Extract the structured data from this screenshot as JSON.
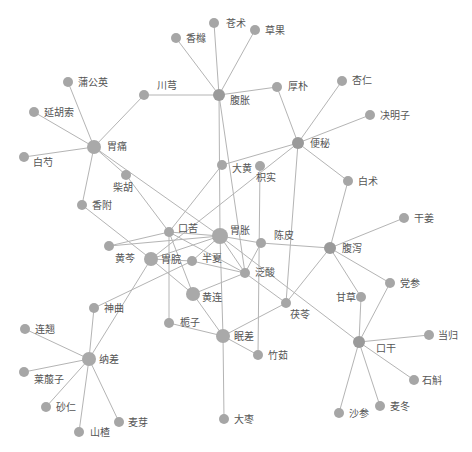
{
  "diagram": {
    "type": "network",
    "caption": "",
    "colors": {
      "edge": "#b4b4b4",
      "node": "#a6a6a6",
      "label": "#555555"
    },
    "nodes": [
      {
        "id": "cangzhu",
        "label": "苍术",
        "x": 214,
        "y": 23,
        "r": 5,
        "lx": 226,
        "ly": 27
      },
      {
        "id": "caoguo",
        "label": "草果",
        "x": 255,
        "y": 30,
        "r": 5,
        "lx": 265,
        "ly": 34
      },
      {
        "id": "xiangyuan",
        "label": "香橼",
        "x": 176,
        "y": 38,
        "r": 5,
        "lx": 186,
        "ly": 42
      },
      {
        "id": "fuzhang",
        "label": "腹胀",
        "x": 219,
        "y": 95,
        "r": 6,
        "lx": 230,
        "ly": 104
      },
      {
        "id": "houpo",
        "label": "厚朴",
        "x": 277,
        "y": 87,
        "r": 5,
        "lx": 288,
        "ly": 90
      },
      {
        "id": "xingren",
        "label": "杏仁",
        "x": 342,
        "y": 81,
        "r": 5,
        "lx": 352,
        "ly": 84
      },
      {
        "id": "juemingzi",
        "label": "决明子",
        "x": 370,
        "y": 115,
        "r": 5,
        "lx": 380,
        "ly": 119
      },
      {
        "id": "bianmi",
        "label": "便秘",
        "x": 298,
        "y": 143,
        "r": 6,
        "lx": 310,
        "ly": 147
      },
      {
        "id": "chuanxiong",
        "label": "川芎",
        "x": 144,
        "y": 95,
        "r": 5,
        "lx": 157,
        "ly": 89
      },
      {
        "id": "pugongying",
        "label": "蒲公英",
        "x": 68,
        "y": 82,
        "r": 5,
        "lx": 78,
        "ly": 86
      },
      {
        "id": "yanhusuo",
        "label": "延胡索",
        "x": 34,
        "y": 112,
        "r": 5,
        "lx": 44,
        "ly": 116
      },
      {
        "id": "weitong",
        "label": "胃痛",
        "x": 94,
        "y": 147,
        "r": 7,
        "lx": 107,
        "ly": 150
      },
      {
        "id": "baishao",
        "label": "白芍",
        "x": 24,
        "y": 157,
        "r": 5,
        "lx": 33,
        "ly": 166
      },
      {
        "id": "chaihu",
        "label": "柴胡",
        "x": 126,
        "y": 175,
        "r": 5,
        "lx": 113,
        "ly": 191
      },
      {
        "id": "xiangfu",
        "label": "香附",
        "x": 82,
        "y": 205,
        "r": 5,
        "lx": 92,
        "ly": 209
      },
      {
        "id": "dahuang",
        "label": "大黄",
        "x": 222,
        "y": 165,
        "r": 5,
        "lx": 232,
        "ly": 172
      },
      {
        "id": "zhishi",
        "label": "枳实",
        "x": 260,
        "y": 166,
        "r": 5,
        "lx": 256,
        "ly": 181
      },
      {
        "id": "baizhu",
        "label": "白术",
        "x": 348,
        "y": 181,
        "r": 5,
        "lx": 358,
        "ly": 185
      },
      {
        "id": "ganjiang",
        "label": "干姜",
        "x": 404,
        "y": 218,
        "r": 5,
        "lx": 414,
        "ly": 222
      },
      {
        "id": "kouku",
        "label": "口苦",
        "x": 169,
        "y": 232,
        "r": 5,
        "lx": 178,
        "ly": 232
      },
      {
        "id": "weizhang",
        "label": "胃胀",
        "x": 220,
        "y": 236,
        "r": 8,
        "lx": 230,
        "ly": 234
      },
      {
        "id": "chenpi",
        "label": "陈皮",
        "x": 261,
        "y": 243,
        "r": 5,
        "lx": 274,
        "ly": 239
      },
      {
        "id": "fuxie",
        "label": "腹泻",
        "x": 330,
        "y": 248,
        "r": 6,
        "lx": 342,
        "ly": 252
      },
      {
        "id": "huangqin",
        "label": "黄芩",
        "x": 109,
        "y": 246,
        "r": 5,
        "lx": 115,
        "ly": 262
      },
      {
        "id": "weiwan",
        "label": "胃脘",
        "x": 151,
        "y": 259,
        "r": 7,
        "lx": 161,
        "ly": 263
      },
      {
        "id": "banxia",
        "label": "半夏",
        "x": 192,
        "y": 261,
        "r": 5,
        "lx": 202,
        "ly": 262
      },
      {
        "id": "fansuan",
        "label": "泛酸",
        "x": 245,
        "y": 273,
        "r": 5,
        "lx": 255,
        "ly": 276
      },
      {
        "id": "huanglian",
        "label": "黄连",
        "x": 193,
        "y": 294,
        "r": 7,
        "lx": 202,
        "ly": 301
      },
      {
        "id": "shenqu",
        "label": "神曲",
        "x": 94,
        "y": 308,
        "r": 5,
        "lx": 104,
        "ly": 312
      },
      {
        "id": "zhizi",
        "label": "栀子",
        "x": 169,
        "y": 323,
        "r": 5,
        "lx": 180,
        "ly": 326
      },
      {
        "id": "fuling",
        "label": "茯苓",
        "x": 286,
        "y": 303,
        "r": 5,
        "lx": 290,
        "ly": 318
      },
      {
        "id": "gancao",
        "label": "甘草",
        "x": 361,
        "y": 297,
        "r": 5,
        "lx": 336,
        "ly": 301
      },
      {
        "id": "dangshen",
        "label": "党参",
        "x": 390,
        "y": 283,
        "r": 5,
        "lx": 400,
        "ly": 287
      },
      {
        "id": "miancha",
        "label": "眠差",
        "x": 223,
        "y": 336,
        "r": 7,
        "lx": 234,
        "ly": 340
      },
      {
        "id": "zhuru",
        "label": "竹茹",
        "x": 258,
        "y": 355,
        "r": 5,
        "lx": 268,
        "ly": 359
      },
      {
        "id": "kougan",
        "label": "口干",
        "x": 359,
        "y": 342,
        "r": 6,
        "lx": 376,
        "ly": 352
      },
      {
        "id": "danggui",
        "label": "当归",
        "x": 429,
        "y": 335,
        "r": 5,
        "lx": 438,
        "ly": 339
      },
      {
        "id": "shihu",
        "label": "石斛",
        "x": 414,
        "y": 380,
        "r": 5,
        "lx": 422,
        "ly": 384
      },
      {
        "id": "nacha",
        "label": "纳差",
        "x": 89,
        "y": 359,
        "r": 7,
        "lx": 99,
        "ly": 363
      },
      {
        "id": "lianqiao",
        "label": "连翘",
        "x": 25,
        "y": 329,
        "r": 5,
        "lx": 35,
        "ly": 333
      },
      {
        "id": "laifuzi",
        "label": "莱菔子",
        "x": 24,
        "y": 372,
        "r": 5,
        "lx": 34,
        "ly": 383
      },
      {
        "id": "sharen",
        "label": "砂仁",
        "x": 46,
        "y": 407,
        "r": 5,
        "lx": 56,
        "ly": 411
      },
      {
        "id": "shanzha",
        "label": "山楂",
        "x": 79,
        "y": 432,
        "r": 5,
        "lx": 90,
        "ly": 436
      },
      {
        "id": "maiya",
        "label": "麦芽",
        "x": 119,
        "y": 422,
        "r": 5,
        "lx": 128,
        "ly": 426
      },
      {
        "id": "dazao",
        "label": "大枣",
        "x": 224,
        "y": 419,
        "r": 5,
        "lx": 234,
        "ly": 423
      },
      {
        "id": "shashen",
        "label": "沙参",
        "x": 339,
        "y": 413,
        "r": 5,
        "lx": 349,
        "ly": 417
      },
      {
        "id": "maidong",
        "label": "麦冬",
        "x": 380,
        "y": 406,
        "r": 5,
        "lx": 390,
        "ly": 410
      }
    ],
    "edges": [
      [
        "fuzhang",
        "cangzhu"
      ],
      [
        "fuzhang",
        "caoguo"
      ],
      [
        "fuzhang",
        "xiangyuan"
      ],
      [
        "fuzhang",
        "houpo"
      ],
      [
        "fuzhang",
        "chuanxiong"
      ],
      [
        "fuzhang",
        "weizhang"
      ],
      [
        "fuzhang",
        "fansuan"
      ],
      [
        "chuanxiong",
        "weitong"
      ],
      [
        "houpo",
        "bianmi"
      ],
      [
        "bianmi",
        "xingren"
      ],
      [
        "bianmi",
        "juemingzi"
      ],
      [
        "bianmi",
        "dahuang"
      ],
      [
        "bianmi",
        "baizhu"
      ],
      [
        "bianmi",
        "fuling"
      ],
      [
        "bianmi",
        "weiwan"
      ],
      [
        "weitong",
        "pugongying"
      ],
      [
        "weitong",
        "yanhusuo"
      ],
      [
        "weitong",
        "baishao"
      ],
      [
        "weitong",
        "chaihu"
      ],
      [
        "weitong",
        "xiangfu"
      ],
      [
        "weitong",
        "weizhang"
      ],
      [
        "chaihu",
        "kouku"
      ],
      [
        "xiangfu",
        "weiwan"
      ],
      [
        "dahuang",
        "kouku"
      ],
      [
        "zhishi",
        "zhuru"
      ],
      [
        "baizhu",
        "fuxie"
      ],
      [
        "fuxie",
        "ganjiang"
      ],
      [
        "fuxie",
        "chenpi"
      ],
      [
        "fuxie",
        "gancao"
      ],
      [
        "fuxie",
        "dangshen"
      ],
      [
        "fuxie",
        "fuling"
      ],
      [
        "kouku",
        "weizhang"
      ],
      [
        "kouku",
        "huangqin"
      ],
      [
        "kouku",
        "zhizi"
      ],
      [
        "kouku",
        "huanglian"
      ],
      [
        "kouku",
        "fansuan"
      ],
      [
        "weizhang",
        "chenpi"
      ],
      [
        "weizhang",
        "weiwan"
      ],
      [
        "weizhang",
        "banxia"
      ],
      [
        "weizhang",
        "fansuan"
      ],
      [
        "weizhang",
        "miancha"
      ],
      [
        "weizhang",
        "kougan"
      ],
      [
        "weizhang",
        "huangqin"
      ],
      [
        "chenpi",
        "fansuan"
      ],
      [
        "weiwan",
        "huanglian"
      ],
      [
        "weiwan",
        "nacha"
      ],
      [
        "weiwan",
        "banxia"
      ],
      [
        "banxia",
        "fansuan"
      ],
      [
        "banxia",
        "shenqu"
      ],
      [
        "fansuan",
        "fuling"
      ],
      [
        "fansuan",
        "huanglian"
      ],
      [
        "huanglian",
        "miancha"
      ],
      [
        "zhizi",
        "miancha"
      ],
      [
        "miancha",
        "fuling"
      ],
      [
        "miancha",
        "zhuru"
      ],
      [
        "miancha",
        "dazao"
      ],
      [
        "gancao",
        "kougan"
      ],
      [
        "dangshen",
        "kougan"
      ],
      [
        "kougan",
        "danggui"
      ],
      [
        "kougan",
        "shihu"
      ],
      [
        "kougan",
        "shashen"
      ],
      [
        "kougan",
        "maidong"
      ],
      [
        "nacha",
        "shenqu"
      ],
      [
        "nacha",
        "lianqiao"
      ],
      [
        "nacha",
        "laifuzi"
      ],
      [
        "nacha",
        "sharen"
      ],
      [
        "nacha",
        "shanzha"
      ],
      [
        "nacha",
        "maiya"
      ]
    ]
  }
}
